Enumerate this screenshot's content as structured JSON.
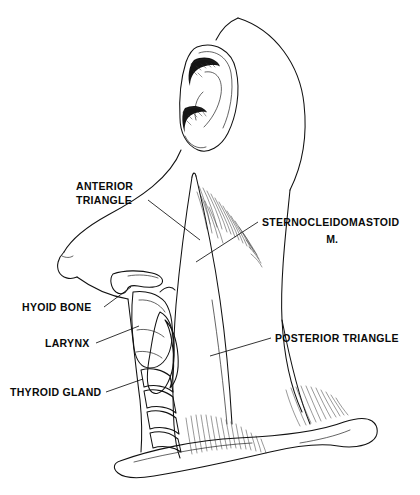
{
  "figure": {
    "background_color": "#ffffff",
    "ink_color": "#111111",
    "style": "black-and-white medical line illustration with stipple shading"
  },
  "labels": [
    {
      "id": "anterior-triangle",
      "lines": [
        "ANTERIOR",
        "TRIANGLE"
      ],
      "line1": "ANTERIOR",
      "line2": "TRIANGLE",
      "side": "left",
      "text_x": 76,
      "text_y": 190,
      "leader_from": [
        148,
        200
      ],
      "leader_to": [
        200,
        240
      ]
    },
    {
      "id": "sternocleidomastoid",
      "lines": [
        "STERNOCLEIDOMASTOID",
        "M."
      ],
      "line1": "STERNOCLEIDOMASTOID",
      "line2": "M.",
      "side": "right",
      "text_x": 262,
      "text_y": 226,
      "leader_from": [
        258,
        222
      ],
      "leader_to": [
        196,
        262
      ]
    },
    {
      "id": "hyoid-bone",
      "lines": [
        "HYOID BONE"
      ],
      "line1": "HYOID BONE",
      "side": "left",
      "text_x": 22,
      "text_y": 311,
      "leader_from": [
        104,
        307
      ],
      "leader_to": [
        131,
        287
      ]
    },
    {
      "id": "larynx",
      "lines": [
        "LARYNX"
      ],
      "line1": "LARYNX",
      "side": "left",
      "text_x": 45,
      "text_y": 347,
      "leader_from": [
        96,
        343
      ],
      "leader_to": [
        139,
        326
      ]
    },
    {
      "id": "thyroid-gland",
      "lines": [
        "THYROID GLAND"
      ],
      "line1": "THYROID GLAND",
      "side": "left",
      "text_x": 10,
      "text_y": 396,
      "leader_from": [
        106,
        392
      ],
      "leader_to": [
        143,
        379
      ]
    },
    {
      "id": "posterior-triangle",
      "lines": [
        "POSTERIOR TRIANGLE"
      ],
      "line1": "POSTERIOR TRIANGLE",
      "side": "right",
      "text_x": 275,
      "text_y": 342,
      "leader_from": [
        271,
        338
      ],
      "leader_to": [
        210,
        356
      ]
    }
  ],
  "structures": [
    {
      "id": "ear",
      "name": "auricle / external ear"
    },
    {
      "id": "head-contour",
      "name": "head and posterior scalp contour"
    },
    {
      "id": "mandible",
      "name": "mandible and chin contour"
    },
    {
      "id": "sternocleidomastoid-muscle",
      "name": "sternocleidomastoid muscle"
    },
    {
      "id": "trapezius-muscle",
      "name": "trapezius muscle border"
    },
    {
      "id": "hyoid-bone-structure",
      "name": "hyoid bone"
    },
    {
      "id": "thyroid-cartilage",
      "name": "thyroid cartilage / larynx"
    },
    {
      "id": "thyroid-gland-structure",
      "name": "thyroid gland lobe"
    },
    {
      "id": "trachea",
      "name": "tracheal rings"
    },
    {
      "id": "clavicle",
      "name": "clavicle"
    }
  ]
}
